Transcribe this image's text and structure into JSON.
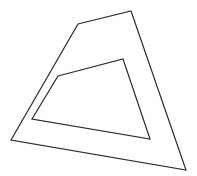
{
  "diagram": {
    "background": "#ffffff",
    "stroke_color": "#2a2a2a",
    "stroke_width": 1.2,
    "shapes": [
      {
        "name": "outer-quadrilateral",
        "points": "78,24 131,11 186,170 11,140"
      },
      {
        "name": "inner-quadrilateral",
        "points": "58,76 123,59 150,139 32,119"
      }
    ]
  }
}
